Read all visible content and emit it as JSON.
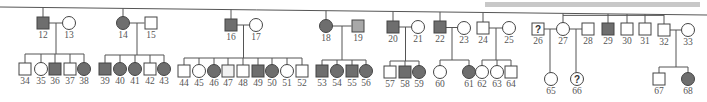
{
  "colors": {
    "affected": "#6e6e6e",
    "light": "#a8a8a8",
    "faint": "#f2f2f2",
    "unaffected": "#ffffff",
    "line": "#555555",
    "banner": "#c8c8c8"
  },
  "generation_II": [
    {
      "id": "12",
      "sex": "male",
      "status": "affected",
      "x": 43,
      "y": 23
    },
    {
      "id": "13",
      "sex": "female",
      "status": "unaffected",
      "x": 69,
      "y": 23
    },
    {
      "id": "14",
      "sex": "female",
      "status": "affected",
      "x": 123,
      "y": 23
    },
    {
      "id": "15",
      "sex": "male",
      "status": "unaffected",
      "x": 151,
      "y": 23
    },
    {
      "id": "16",
      "sex": "male",
      "status": "affected",
      "x": 231,
      "y": 25
    },
    {
      "id": "17",
      "sex": "female",
      "status": "unaffected",
      "x": 256,
      "y": 25
    },
    {
      "id": "18",
      "sex": "female",
      "status": "affected",
      "x": 326,
      "y": 26
    },
    {
      "id": "19",
      "sex": "male",
      "status": "light",
      "x": 358,
      "y": 26
    },
    {
      "id": "20",
      "sex": "male",
      "status": "affected",
      "x": 393,
      "y": 27
    },
    {
      "id": "21",
      "sex": "female",
      "status": "unaffected",
      "x": 418,
      "y": 27
    },
    {
      "id": "22",
      "sex": "male",
      "status": "affected",
      "x": 440,
      "y": 27
    },
    {
      "id": "23",
      "sex": "female",
      "status": "unaffected",
      "x": 464,
      "y": 28
    },
    {
      "id": "24",
      "sex": "male",
      "status": "unaffected",
      "x": 483,
      "y": 28
    },
    {
      "id": "25",
      "sex": "female",
      "status": "unaffected",
      "x": 509,
      "y": 28
    },
    {
      "id": "26",
      "sex": "male",
      "status": "unknown",
      "x": 538,
      "y": 29
    },
    {
      "id": "27",
      "sex": "female",
      "status": "unaffected",
      "x": 563,
      "y": 29
    },
    {
      "id": "28",
      "sex": "male",
      "status": "unaffected",
      "x": 588,
      "y": 29
    },
    {
      "id": "29",
      "sex": "male",
      "status": "affected",
      "x": 608,
      "y": 29
    },
    {
      "id": "30",
      "sex": "male",
      "status": "unaffected",
      "x": 627,
      "y": 29
    },
    {
      "id": "31",
      "sex": "male",
      "status": "unaffected",
      "x": 645,
      "y": 29
    },
    {
      "id": "32",
      "sex": "male",
      "status": "unaffected",
      "x": 664,
      "y": 30
    },
    {
      "id": "33",
      "sex": "female",
      "status": "unaffected",
      "x": 688,
      "y": 30
    }
  ],
  "generation_III": [
    {
      "id": "34",
      "sex": "male",
      "status": "unaffected",
      "x": 25,
      "y": 69
    },
    {
      "id": "35",
      "sex": "female",
      "status": "unaffected",
      "x": 41,
      "y": 69
    },
    {
      "id": "36",
      "sex": "male",
      "status": "affected",
      "x": 55,
      "y": 69
    },
    {
      "id": "37",
      "sex": "male",
      "status": "unaffected",
      "x": 70,
      "y": 69
    },
    {
      "id": "38",
      "sex": "female",
      "status": "affected",
      "x": 84,
      "y": 69
    },
    {
      "id": "39",
      "sex": "male",
      "status": "affected",
      "x": 105,
      "y": 69
    },
    {
      "id": "40",
      "sex": "female",
      "status": "affected",
      "x": 120,
      "y": 69
    },
    {
      "id": "41",
      "sex": "female",
      "status": "affected",
      "x": 135,
      "y": 69
    },
    {
      "id": "42",
      "sex": "male",
      "status": "unaffected",
      "x": 150,
      "y": 69
    },
    {
      "id": "43",
      "sex": "female",
      "status": "affected",
      "x": 164,
      "y": 69
    },
    {
      "id": "44",
      "sex": "male",
      "status": "unaffected",
      "x": 184,
      "y": 71
    },
    {
      "id": "45",
      "sex": "female",
      "status": "unaffected",
      "x": 199,
      "y": 71
    },
    {
      "id": "46",
      "sex": "female",
      "status": "affected",
      "x": 214,
      "y": 71
    },
    {
      "id": "47",
      "sex": "male",
      "status": "faint",
      "x": 228,
      "y": 71
    },
    {
      "id": "48",
      "sex": "male",
      "status": "unaffected",
      "x": 243,
      "y": 71
    },
    {
      "id": "49",
      "sex": "male",
      "status": "affected",
      "x": 258,
      "y": 71
    },
    {
      "id": "50",
      "sex": "female",
      "status": "affected",
      "x": 272,
      "y": 71
    },
    {
      "id": "51",
      "sex": "female",
      "status": "unaffected",
      "x": 287,
      "y": 71
    },
    {
      "id": "52",
      "sex": "male",
      "status": "unaffected",
      "x": 302,
      "y": 71
    },
    {
      "id": "53",
      "sex": "male",
      "status": "affected",
      "x": 322,
      "y": 71
    },
    {
      "id": "54",
      "sex": "female",
      "status": "affected",
      "x": 337,
      "y": 71
    },
    {
      "id": "55",
      "sex": "male",
      "status": "affected",
      "x": 352,
      "y": 71
    },
    {
      "id": "56",
      "sex": "female",
      "status": "affected",
      "x": 366,
      "y": 71
    },
    {
      "id": "57",
      "sex": "male",
      "status": "unaffected",
      "x": 390,
      "y": 72
    },
    {
      "id": "58",
      "sex": "male",
      "status": "affected",
      "x": 405,
      "y": 72
    },
    {
      "id": "59",
      "sex": "female",
      "status": "affected",
      "x": 419,
      "y": 72
    },
    {
      "id": "60",
      "sex": "female",
      "status": "unaffected",
      "x": 440,
      "y": 72
    },
    {
      "id": "61",
      "sex": "female",
      "status": "affected",
      "x": 469,
      "y": 72
    },
    {
      "id": "62",
      "sex": "female",
      "status": "unaffected",
      "x": 482,
      "y": 72
    },
    {
      "id": "63",
      "sex": "female",
      "status": "unaffected",
      "x": 497,
      "y": 72
    },
    {
      "id": "64",
      "sex": "male",
      "status": "unaffected",
      "x": 511,
      "y": 72
    },
    {
      "id": "65",
      "sex": "female",
      "status": "unaffected",
      "x": 551,
      "y": 79
    },
    {
      "id": "66",
      "sex": "female",
      "status": "unknown",
      "x": 577,
      "y": 79
    },
    {
      "id": "67",
      "sex": "male",
      "status": "unaffected",
      "x": 659,
      "y": 79
    },
    {
      "id": "68",
      "sex": "female",
      "status": "affected",
      "x": 688,
      "y": 79
    }
  ],
  "unknown_mark": "?"
}
